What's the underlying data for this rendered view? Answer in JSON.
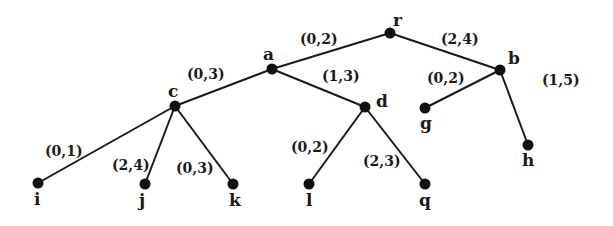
{
  "diagram": {
    "type": "tree",
    "nodes": [
      {
        "id": "r",
        "label": "r",
        "x": 390,
        "y": 33,
        "lx": 393,
        "ly": 26
      },
      {
        "id": "a",
        "label": "a",
        "x": 272,
        "y": 69,
        "lx": 263,
        "ly": 60
      },
      {
        "id": "b",
        "label": "b",
        "x": 500,
        "y": 70,
        "lx": 508,
        "ly": 64
      },
      {
        "id": "c",
        "label": "c",
        "x": 175,
        "y": 106,
        "lx": 168,
        "ly": 97
      },
      {
        "id": "d",
        "label": "d",
        "x": 365,
        "y": 107,
        "lx": 376,
        "ly": 107
      },
      {
        "id": "g",
        "label": "g",
        "x": 425,
        "y": 108,
        "lx": 420,
        "ly": 129
      },
      {
        "id": "h",
        "label": "h",
        "x": 528,
        "y": 145,
        "lx": 522,
        "ly": 166
      },
      {
        "id": "i",
        "label": "i",
        "x": 38,
        "y": 183,
        "lx": 34,
        "ly": 205
      },
      {
        "id": "j",
        "label": "j",
        "x": 145,
        "y": 184,
        "lx": 139,
        "ly": 206
      },
      {
        "id": "k",
        "label": "k",
        "x": 233,
        "y": 184,
        "lx": 229,
        "ly": 206
      },
      {
        "id": "l",
        "label": "l",
        "x": 309,
        "y": 184,
        "lx": 306,
        "ly": 206
      },
      {
        "id": "q",
        "label": "q",
        "x": 425,
        "y": 184,
        "lx": 419,
        "ly": 206
      }
    ],
    "edges": [
      {
        "from": "r",
        "to": "a",
        "label": "(0,2)",
        "lx": 300,
        "ly": 44
      },
      {
        "from": "r",
        "to": "b",
        "label": "(2,4)",
        "lx": 441,
        "ly": 44
      },
      {
        "from": "a",
        "to": "c",
        "label": "(0,3)",
        "lx": 187,
        "ly": 79
      },
      {
        "from": "a",
        "to": "d",
        "label": "(1,3)",
        "lx": 322,
        "ly": 81
      },
      {
        "from": "b",
        "to": "g",
        "label": "(0,2)",
        "lx": 427,
        "ly": 83
      },
      {
        "from": "b",
        "to": "h",
        "label": "(1,5)",
        "lx": 542,
        "ly": 85
      },
      {
        "from": "c",
        "to": "i",
        "label": "(0,1)",
        "lx": 45,
        "ly": 156
      },
      {
        "from": "c",
        "to": "j",
        "label": "(2,4)",
        "lx": 112,
        "ly": 170
      },
      {
        "from": "c",
        "to": "k",
        "label": "(0,3)",
        "lx": 176,
        "ly": 173
      },
      {
        "from": "d",
        "to": "l",
        "label": "(0,2)",
        "lx": 291,
        "ly": 152
      },
      {
        "from": "d",
        "to": "q",
        "label": "(2,3)",
        "lx": 363,
        "ly": 166
      }
    ]
  }
}
